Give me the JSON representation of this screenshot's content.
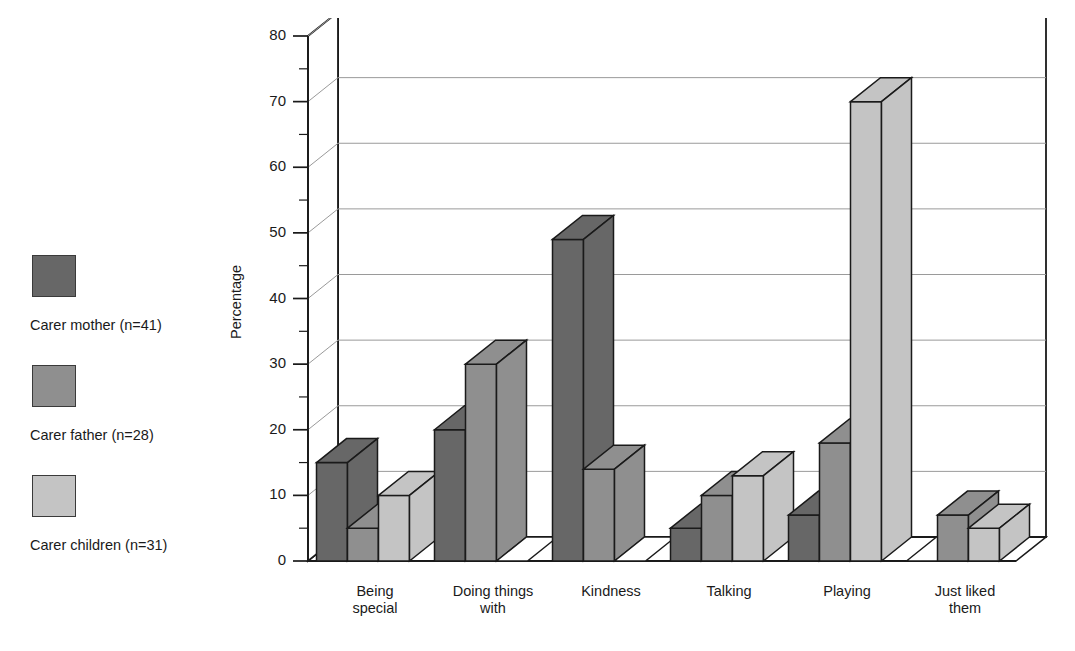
{
  "chart_data": {
    "type": "bar",
    "title": "",
    "xlabel": "",
    "ylabel": "Percentage",
    "ylim": [
      0,
      80
    ],
    "ytick_step": 10,
    "yticks": [
      0,
      10,
      20,
      30,
      40,
      50,
      60,
      70,
      80
    ],
    "minor_tick_step": 5,
    "grid": true,
    "grid_axis": "y",
    "legend_position": "left",
    "style": "3d-isometric-column",
    "categories": [
      "Being\nspecial",
      "Doing things\nwith",
      "Kindness",
      "Talking",
      "Playing",
      "Just liked\nthem"
    ],
    "categories_plain": [
      "Being special",
      "Doing things with",
      "Kindness",
      "Talking",
      "Playing",
      "Just liked them"
    ],
    "series": [
      {
        "name": "Carer mother (n=41)",
        "color": "#676767",
        "values": [
          15,
          20,
          49,
          5,
          7,
          0
        ]
      },
      {
        "name": "Carer father (n=28)",
        "color": "#8f8f8f",
        "values": [
          5,
          30,
          14,
          10,
          18,
          7
        ]
      },
      {
        "name": "Carer children (n=31)",
        "color": "#c4c4c4",
        "values": [
          10,
          0,
          0,
          13,
          70,
          5
        ]
      }
    ]
  },
  "legend": {
    "items": [
      {
        "label": "Carer mother (n=41)",
        "color": "#676767"
      },
      {
        "label": "Carer father (n=28)",
        "color": "#8f8f8f"
      },
      {
        "label": "Carer children (n=31)",
        "color": "#c4c4c4"
      }
    ]
  },
  "axes": {
    "y_title": "Percentage",
    "y_tick_labels": [
      "80",
      "70",
      "60",
      "50",
      "40",
      "30",
      "20",
      "10",
      "0"
    ]
  }
}
